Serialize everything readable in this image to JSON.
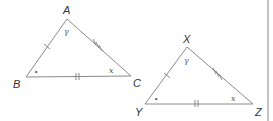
{
  "figure": {
    "triangles": [
      {
        "id": "ABC",
        "vertices": {
          "top": {
            "label": "A",
            "angle_mark": "γ"
          },
          "left": {
            "label": "B",
            "angle_mark": "∘"
          },
          "right": {
            "label": "C",
            "angle_mark": "x"
          }
        },
        "side_ticks": {
          "AB": 1,
          "AC": 3,
          "BC": 2
        }
      },
      {
        "id": "XYZ",
        "vertices": {
          "top": {
            "label": "X",
            "angle_mark": "γ"
          },
          "left": {
            "label": "Y",
            "angle_mark": "∘"
          },
          "right": {
            "label": "Z",
            "angle_mark": "x"
          }
        },
        "side_ticks": {
          "XY": 1,
          "XZ": 3,
          "YZ": 2
        }
      }
    ],
    "colors": {
      "lines": "#8a8a8a",
      "text": "#333333",
      "right_rule": "#9a9a9a"
    }
  }
}
